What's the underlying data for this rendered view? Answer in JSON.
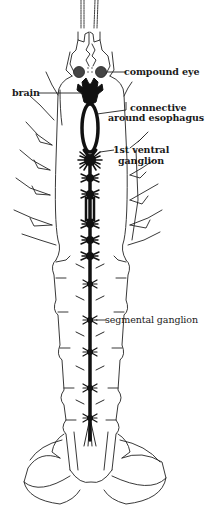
{
  "figure": {
    "labels": {
      "compound_eye": "compound eye",
      "brain": "brain",
      "connective_line1": "connective",
      "connective_line2": "around esophagus",
      "ventral_line1": "1st ventral",
      "ventral_line2": "ganglion",
      "segmental": "segmental ganglion"
    },
    "colors": {
      "ink": "#111111",
      "background": "#ffffff"
    }
  }
}
